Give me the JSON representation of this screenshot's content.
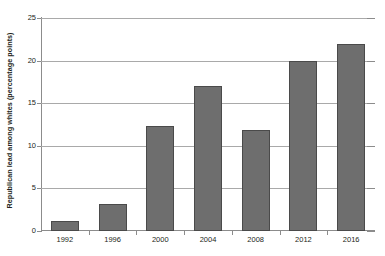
{
  "chart_data": {
    "type": "bar",
    "title": "",
    "subtitle": "",
    "xlabel": "",
    "ylabel": "Republican lead among whites  (percentage points)",
    "categories": [
      "1992",
      "1996",
      "2000",
      "2004",
      "2008",
      "2012",
      "2016"
    ],
    "values": [
      1.2,
      3.2,
      12.3,
      17.0,
      11.8,
      20.0,
      22.0
    ],
    "series": [
      {
        "name": "Republican lead among whites",
        "values": [
          1.2,
          3.2,
          12.3,
          17.0,
          11.8,
          20.0,
          22.0
        ]
      }
    ],
    "ylim": [
      0,
      25
    ],
    "yticks": [
      0,
      5,
      10,
      15,
      20,
      25
    ],
    "ytick_labels": [
      "0",
      "5",
      "10",
      "15",
      "20",
      "25"
    ],
    "grid": true,
    "grid_axis": "y",
    "legend": false,
    "legend_position": "none",
    "bar_color": "#6e6e6e",
    "bar_edge_color": "#4a4a4a",
    "gridline_color": "#a9a9a9",
    "axis_color": "#8c8c8c",
    "background_color": "#ffffff",
    "text_color": "#231f20"
  }
}
